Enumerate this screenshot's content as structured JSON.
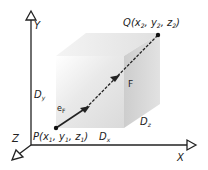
{
  "diagram": {
    "axes": {
      "x_label": "X",
      "y_label": "Y",
      "z_label": "Z"
    },
    "points": {
      "P": {
        "name": "P",
        "open": "(x",
        "s1": "1",
        "c1": ", y",
        "s2": "1",
        "c2": ", z",
        "s3": "1",
        "close": ")"
      },
      "Q": {
        "name": "Q",
        "open": "(x",
        "s1": "2",
        "c1": ", y",
        "s2": "2",
        "c2": ", z",
        "s3": "2",
        "close": ")"
      }
    },
    "dimensions": {
      "dx": {
        "main": "D",
        "sub": "x"
      },
      "dy": {
        "main": "D",
        "sub": "y"
      },
      "dz": {
        "main": "D",
        "sub": "z"
      }
    },
    "vector": {
      "label": "F",
      "unit_main": "e",
      "unit_sub": "F"
    },
    "colors": {
      "line": "#222222",
      "box_front": "#e6e6e6",
      "box_top": "#efefef",
      "box_side": "#cfcfcf"
    }
  }
}
